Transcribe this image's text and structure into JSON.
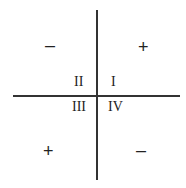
{
  "diagram": {
    "quadrants": [
      {
        "id": "I",
        "label": "I",
        "sign": "+"
      },
      {
        "id": "II",
        "label": "II",
        "sign": "–"
      },
      {
        "id": "III",
        "label": "III",
        "sign": "+"
      },
      {
        "id": "IV",
        "label": "IV",
        "sign": "–"
      }
    ]
  }
}
